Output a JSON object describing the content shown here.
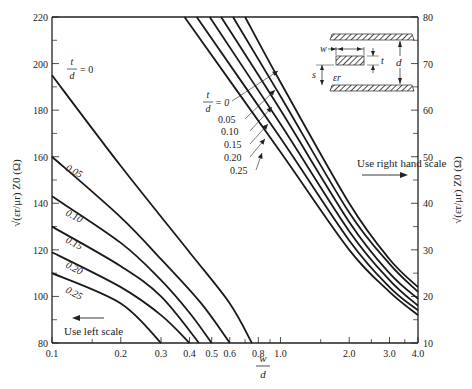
{
  "chart_data": {
    "type": "line",
    "title": "",
    "xlabel_num": "w",
    "xlabel_den": "d",
    "ylabel_left": "√(εr/μr) Z0 (Ω)",
    "ylabel_right": "√(εr/μr) Z0 (Ω)",
    "x_scale": "log",
    "xlim": [
      0.1,
      4.0
    ],
    "ylim_left": [
      80,
      220
    ],
    "ylim_right": [
      10,
      80
    ],
    "x_ticks": [
      "0.1",
      "0.2",
      "0.3",
      "0.4",
      "0.5",
      "0.6",
      "0.8",
      "1.0",
      "2.0",
      "3.0",
      "4.0"
    ],
    "x_tick_values": [
      0.1,
      0.2,
      0.3,
      0.4,
      0.5,
      0.6,
      0.8,
      1.0,
      2.0,
      3.0,
      4.0
    ],
    "y_left_ticks": [
      "80",
      "100",
      "120",
      "140",
      "160",
      "180",
      "200",
      "220"
    ],
    "y_right_ticks": [
      "10",
      "20",
      "30",
      "40",
      "50",
      "60",
      "70",
      "80"
    ],
    "grid": false,
    "left_scale_series": [
      {
        "name": "t/d = 0",
        "x": [
          0.1,
          0.2,
          0.4,
          0.6,
          0.75
        ],
        "y": [
          195,
          156,
          119,
          97,
          80
        ]
      },
      {
        "name": "0.05",
        "x": [
          0.1,
          0.2,
          0.3,
          0.45,
          0.6
        ],
        "y": [
          160,
          134,
          116,
          97,
          80
        ]
      },
      {
        "name": "0.10",
        "x": [
          0.1,
          0.2,
          0.3,
          0.4,
          0.5
        ],
        "y": [
          143,
          123,
          107,
          93,
          80
        ]
      },
      {
        "name": "0.15",
        "x": [
          0.1,
          0.2,
          0.3,
          0.44
        ],
        "y": [
          130,
          113,
          100,
          80
        ]
      },
      {
        "name": "0.20",
        "x": [
          0.1,
          0.2,
          0.3,
          0.4
        ],
        "y": [
          119,
          104,
          92,
          80
        ]
      },
      {
        "name": "0.25",
        "x": [
          0.1,
          0.2,
          0.3
        ],
        "y": [
          110,
          97,
          80
        ]
      }
    ],
    "right_scale_series": [
      {
        "name": "t/d = 0",
        "x": [
          0.7,
          1.0,
          2.0,
          3.0,
          4.0
        ],
        "y": [
          80,
          66,
          40,
          28,
          22
        ]
      },
      {
        "name": "0.05",
        "x": [
          0.62,
          1.0,
          2.0,
          3.0,
          4.0
        ],
        "y": [
          80,
          63,
          38,
          27,
          21
        ]
      },
      {
        "name": "0.10",
        "x": [
          0.55,
          1.0,
          2.0,
          3.0,
          4.0
        ],
        "y": [
          80,
          60,
          36,
          25,
          19.5
        ]
      },
      {
        "name": "0.15",
        "x": [
          0.49,
          1.0,
          2.0,
          3.0,
          4.0
        ],
        "y": [
          80,
          57,
          34,
          23.5,
          18
        ]
      },
      {
        "name": "0.20",
        "x": [
          0.43,
          1.0,
          2.0,
          3.0,
          4.0
        ],
        "y": [
          80,
          54,
          32,
          22,
          17
        ]
      },
      {
        "name": "0.25",
        "x": [
          0.38,
          1.0,
          2.0,
          3.0,
          4.0
        ],
        "y": [
          80,
          51,
          30,
          21,
          16
        ]
      }
    ],
    "annotations": {
      "left_t_over_d": "t",
      "left_d": "d",
      "left_eq_zero": "= 0",
      "left_labels": [
        "0.05",
        "0.10",
        "0.15",
        "0.20",
        "0.25"
      ],
      "right_t": "t",
      "right_d": "d",
      "right_eq_zero": "= 0",
      "right_labels": [
        "0.05",
        "0.10",
        "0.15",
        "0.20",
        "0.25"
      ],
      "use_left_scale": "Use left scale",
      "use_right_scale": "Use right hand scale"
    },
    "inset": {
      "w": "w",
      "t": "t",
      "d": "d",
      "s": "s",
      "er": "εr"
    }
  }
}
